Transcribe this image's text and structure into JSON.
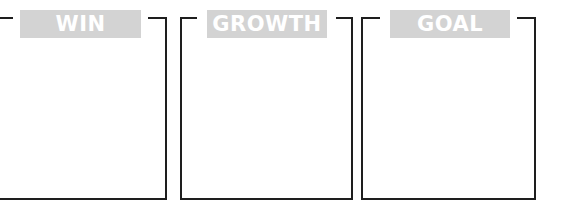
{
  "panels": [
    {
      "title": "WIN",
      "content": ""
    },
    {
      "title": "GROWTH",
      "content": ""
    },
    {
      "title": "GOAL",
      "content": ""
    }
  ],
  "colors": {
    "banner_fill": "#d3d3d3",
    "banner_text": "#ffffff",
    "frame": "#1e1e1e",
    "background": "#ffffff"
  }
}
